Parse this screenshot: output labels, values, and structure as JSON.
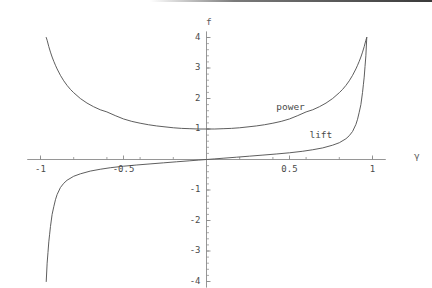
{
  "chart_data": {
    "type": "line",
    "title": "",
    "subtitle": "",
    "xlabel": "γ",
    "ylabel": "f",
    "xlim": [
      -1.08,
      1.08
    ],
    "ylim": [
      -4.2,
      4.2
    ],
    "grid": false,
    "legend_position": "inline-annotations",
    "background": "#ffffff",
    "axis_color": "#8a8a8a",
    "curve_color": "#555555",
    "text_color": "#4a4a4a",
    "xticks": [
      {
        "value": -1,
        "label": "-1"
      },
      {
        "value": -0.5,
        "label": "-0.5"
      },
      {
        "value": 0.5,
        "label": "0.5"
      },
      {
        "value": 1,
        "label": "1"
      }
    ],
    "yticks": [
      {
        "value": 4,
        "label": "4"
      },
      {
        "value": 3,
        "label": "3"
      },
      {
        "value": 2,
        "label": "2"
      },
      {
        "value": 1,
        "label": "1"
      },
      {
        "value": -1,
        "label": "-1"
      },
      {
        "value": -2,
        "label": "-2"
      },
      {
        "value": -3,
        "label": "-3"
      },
      {
        "value": -4,
        "label": "-4"
      }
    ],
    "minor_tick_step": 0.2,
    "series": [
      {
        "name": "power",
        "label": "power",
        "label_x": 0.42,
        "label_y": 1.72,
        "formula": "1/(1-γ^2)",
        "x": [
          -0.9655,
          -0.96,
          -0.95,
          -0.94,
          -0.93,
          -0.92,
          -0.91,
          -0.9,
          -0.88,
          -0.86,
          -0.84,
          -0.82,
          -0.8,
          -0.76,
          -0.72,
          -0.68,
          -0.64,
          -0.6,
          -0.55,
          -0.5,
          -0.45,
          -0.4,
          -0.35,
          -0.3,
          -0.25,
          -0.2,
          -0.15,
          -0.1,
          -0.05,
          0.0,
          0.05,
          0.1,
          0.15,
          0.2,
          0.25,
          0.3,
          0.35,
          0.4,
          0.45,
          0.5,
          0.55,
          0.6,
          0.64,
          0.68,
          0.72,
          0.76,
          0.8,
          0.82,
          0.84,
          0.86,
          0.88,
          0.9,
          0.91,
          0.92,
          0.93,
          0.94,
          0.95,
          0.96,
          0.9655
        ],
        "y": [
          4.0,
          3.91,
          3.7,
          3.52,
          3.36,
          3.22,
          3.09,
          2.97,
          2.76,
          2.58,
          2.43,
          2.3,
          2.19,
          2.0,
          1.85,
          1.73,
          1.63,
          1.56,
          1.44,
          1.33,
          1.25,
          1.19,
          1.14,
          1.1,
          1.07,
          1.04,
          1.02,
          1.01,
          1.0,
          1.0,
          1.0,
          1.01,
          1.02,
          1.04,
          1.07,
          1.1,
          1.14,
          1.19,
          1.25,
          1.33,
          1.44,
          1.56,
          1.63,
          1.73,
          1.85,
          2.0,
          2.19,
          2.3,
          2.43,
          2.58,
          2.76,
          2.97,
          3.09,
          3.22,
          3.36,
          3.52,
          3.7,
          3.91,
          4.0
        ]
      },
      {
        "name": "lift",
        "label": "lift",
        "label_x": 0.62,
        "label_y": 0.8,
        "formula": "γ/(1-γ^2)  (odd, asymptotes at γ=±1)",
        "x": [
          -0.9655,
          -0.96,
          -0.955,
          -0.95,
          -0.945,
          -0.94,
          -0.93,
          -0.92,
          -0.91,
          -0.9,
          -0.88,
          -0.86,
          -0.84,
          -0.8,
          -0.76,
          -0.7,
          -0.64,
          -0.58,
          -0.5,
          -0.42,
          -0.34,
          -0.26,
          -0.18,
          -0.1,
          -0.05,
          0.0,
          0.05,
          0.1,
          0.18,
          0.26,
          0.34,
          0.42,
          0.5,
          0.58,
          0.64,
          0.7,
          0.76,
          0.8,
          0.84,
          0.86,
          0.88,
          0.9,
          0.91,
          0.92,
          0.93,
          0.94,
          0.945,
          0.95,
          0.955,
          0.96,
          0.9655
        ],
        "y": [
          -4.0,
          -3.4,
          -3.05,
          -2.7,
          -2.45,
          -2.2,
          -1.8,
          -1.55,
          -1.32,
          -1.15,
          -0.92,
          -0.78,
          -0.68,
          -0.55,
          -0.47,
          -0.38,
          -0.32,
          -0.27,
          -0.22,
          -0.18,
          -0.145,
          -0.11,
          -0.075,
          -0.042,
          -0.021,
          0.0,
          0.021,
          0.042,
          0.075,
          0.11,
          0.145,
          0.18,
          0.22,
          0.27,
          0.32,
          0.38,
          0.47,
          0.55,
          0.68,
          0.78,
          0.92,
          1.15,
          1.32,
          1.55,
          1.8,
          2.2,
          2.45,
          2.7,
          3.05,
          3.4,
          4.0
        ]
      }
    ]
  },
  "labels": {
    "y_axis_name": "f",
    "x_axis_name": "γ"
  }
}
